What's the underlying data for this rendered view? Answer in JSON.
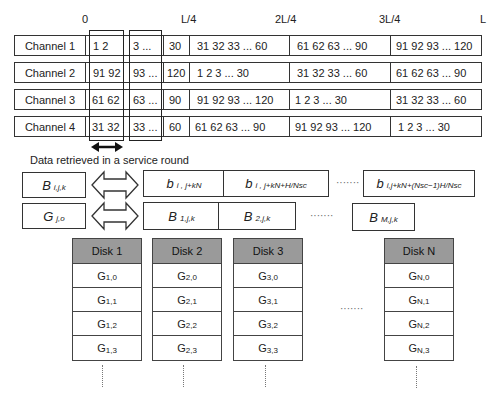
{
  "axis": {
    "ticks": [
      "0",
      "L/4",
      "2L/4",
      "3L/4",
      "L"
    ]
  },
  "channels": [
    {
      "label": "Channel 1",
      "cells": [
        "1   2",
        "3  ...",
        "30",
        "31  32  33 ...   60",
        "61   62   63 ...   90",
        "91  92  93 ...  120"
      ]
    },
    {
      "label": "Channel 2",
      "cells": [
        "91  92",
        "93  ...",
        "120",
        "1    2    3   ...   30",
        "31    32  33 ...   60",
        "61  62  63 ... 90"
      ]
    },
    {
      "label": "Channel 3",
      "cells": [
        "61 62",
        "63  ...",
        "90",
        "91  92  93 ...  120",
        "1    2    3   ...   30",
        "31  32  33 ... 60"
      ]
    },
    {
      "label": "Channel 4",
      "cells": [
        "31 32",
        "33  ...",
        "60",
        "61  62  63 ...   90",
        "91   92   93 ... 120",
        "1   2   3  ...   30"
      ]
    }
  ],
  "service_round_label": "Data retrieved in a service round",
  "mapping_rows": [
    {
      "left": {
        "symbol": "B",
        "sub": "i,j,k"
      },
      "right": [
        {
          "symbol": "b",
          "sub": "i , j+kN"
        },
        {
          "symbol": "b",
          "sub": "i , j+kN+H/Nsc"
        }
      ],
      "ellipsis": "·······",
      "last": {
        "symbol": "b",
        "sub": "i,j+kN+(Nsc−1)H/Nsc"
      }
    },
    {
      "left": {
        "symbol": "G",
        "sub": "j,o"
      },
      "right": [
        {
          "symbol": "B",
          "sub": "1,j,k"
        },
        {
          "symbol": "B",
          "sub": "2,j,k"
        }
      ],
      "ellipsis": "·······",
      "last": {
        "symbol": "B",
        "sub": "M,j,k"
      }
    }
  ],
  "disks": [
    {
      "name": "Disk 1",
      "blocks": [
        {
          "g": "G",
          "sub": "1,0"
        },
        {
          "g": "G",
          "sub": "1,1"
        },
        {
          "g": "G",
          "sub": "1,2"
        },
        {
          "g": "G",
          "sub": "1,3"
        }
      ]
    },
    {
      "name": "Disk 2",
      "blocks": [
        {
          "g": "G",
          "sub": "2,0"
        },
        {
          "g": "G",
          "sub": "2,1"
        },
        {
          "g": "G",
          "sub": "2,2"
        },
        {
          "g": "G",
          "sub": "2,3"
        }
      ]
    },
    {
      "name": "Disk 3",
      "blocks": [
        {
          "g": "G",
          "sub": "3,0"
        },
        {
          "g": "G",
          "sub": "3,1"
        },
        {
          "g": "G",
          "sub": "3,2"
        },
        {
          "g": "G",
          "sub": "3,3"
        }
      ]
    },
    {
      "name": "Disk N",
      "blocks": [
        {
          "g": "G",
          "sub": "N,0"
        },
        {
          "g": "G",
          "sub": "N,1"
        },
        {
          "g": "G",
          "sub": "N,2"
        },
        {
          "g": "G",
          "sub": "N,3"
        }
      ]
    }
  ],
  "disk_ellipsis": "·······",
  "colors": {
    "disk_header": "#9a9a9a",
    "border": "#333333"
  }
}
